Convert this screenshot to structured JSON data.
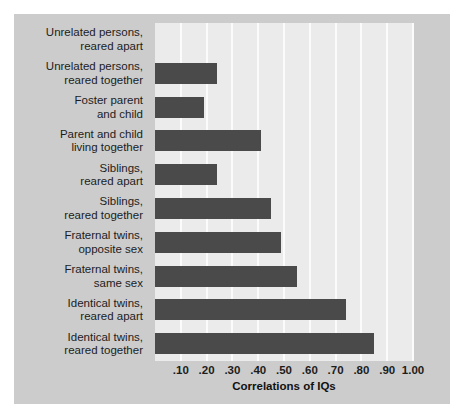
{
  "chart_data": {
    "type": "bar",
    "orientation": "horizontal",
    "title": "",
    "xlabel": "Correlations of IQs",
    "ylabel": "",
    "xlim": [
      0.0,
      1.0
    ],
    "grid": true,
    "legend": false,
    "xticks": [
      ".10",
      ".20",
      ".30",
      ".40",
      ".50",
      ".60",
      ".70",
      ".80",
      ".90",
      "1.00"
    ],
    "xtick_values": [
      0.1,
      0.2,
      0.3,
      0.4,
      0.5,
      0.6,
      0.7,
      0.8,
      0.9,
      1.0
    ],
    "categories": [
      "Unrelated persons, reared apart",
      "Unrelated persons, reared together",
      "Foster parent and child",
      "Parent and child living together",
      "Siblings, reared apart",
      "Siblings, reared together",
      "Fraternal twins, opposite sex",
      "Fraternal twins, same sex",
      "Identical twins, reared apart",
      "Identical twins, reared together"
    ],
    "category_lines": [
      [
        "Unrelated persons,",
        "reared apart"
      ],
      [
        "Unrelated persons,",
        "reared together"
      ],
      [
        "Foster parent",
        "and child"
      ],
      [
        "Parent and child",
        "living together"
      ],
      [
        "Siblings,",
        "reared apart"
      ],
      [
        "Siblings,",
        "reared together"
      ],
      [
        "Fraternal twins,",
        "opposite sex"
      ],
      [
        "Fraternal twins,",
        "same sex"
      ],
      [
        "Identical twins,",
        "reared apart"
      ],
      [
        "Identical twins,",
        "reared together"
      ]
    ],
    "values": [
      0.0,
      0.24,
      0.19,
      0.41,
      0.24,
      0.45,
      0.49,
      0.55,
      0.74,
      0.85
    ]
  },
  "colors": {
    "bar": "#4a4a4a",
    "plot_background": "#ebebeb",
    "panel_background": "#cccccc",
    "gridline": "#fbfbfb",
    "text": "#1c1c1c"
  }
}
